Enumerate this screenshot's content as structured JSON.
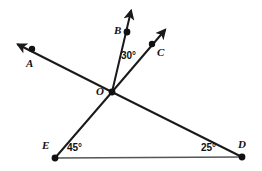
{
  "figure": {
    "background_color": "#ffffff",
    "stroke_color": "#1a1a1a",
    "base_line_color": "#555555",
    "width": 262,
    "height": 171
  },
  "points": {
    "A": {
      "label": "A",
      "x": 32,
      "y": 49,
      "label_x": 26,
      "label_y": 58
    },
    "B": {
      "label": "B",
      "x": 127,
      "y": 32,
      "label_x": 114,
      "label_y": 25
    },
    "C": {
      "label": "C",
      "x": 152,
      "y": 44,
      "label_x": 157,
      "label_y": 47
    },
    "D": {
      "label": "D",
      "x": 242,
      "y": 157,
      "label_x": 238,
      "label_y": 139
    },
    "E": {
      "label": "E",
      "x": 55,
      "y": 158,
      "label_x": 42,
      "label_y": 140
    },
    "O": {
      "label": "O",
      "x": 112,
      "y": 92,
      "label_x": 96,
      "label_y": 86
    }
  },
  "angles": [
    {
      "name": "angle-BOC",
      "value": "30°",
      "x": 121,
      "y": 51
    },
    {
      "name": "angle-OED",
      "value": "45°",
      "x": 67,
      "y": 143
    },
    {
      "name": "angle-ODE",
      "value": "25°",
      "x": 201,
      "y": 143
    }
  ],
  "rays": [
    {
      "name": "ray-OA",
      "from": "O",
      "to": "A",
      "arrow_x": 14,
      "arrow_y": 43
    },
    {
      "name": "ray-OB",
      "from": "O",
      "to": "B",
      "arrow_x": 133,
      "arrow_y": 7
    },
    {
      "name": "ray-OC",
      "from": "O",
      "to": "C",
      "arrow_x": 168,
      "arrow_y": 26
    }
  ],
  "segments": [
    {
      "name": "segment-OD",
      "from": "O",
      "to": "D"
    },
    {
      "name": "segment-OE",
      "from": "O",
      "to": "E"
    },
    {
      "name": "segment-ED",
      "from": "E",
      "to": "D"
    }
  ]
}
